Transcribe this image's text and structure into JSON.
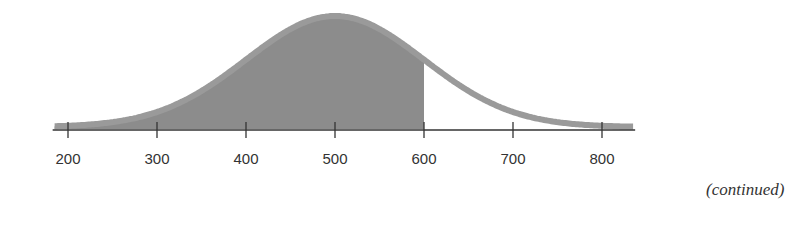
{
  "chart_data": {
    "type": "area",
    "title": "",
    "xlabel": "",
    "ylabel": "",
    "distribution": "normal",
    "mean": 500,
    "std_dev": 100,
    "xlim": [
      160,
      840
    ],
    "shaded_region": {
      "from": 160,
      "to": 600
    },
    "x_ticks": [
      200,
      300,
      400,
      500,
      600,
      700,
      800
    ],
    "x_tick_labels": [
      "200",
      "300",
      "400",
      "500",
      "600",
      "700",
      "800"
    ],
    "grid": false,
    "colors": {
      "curve": "#9a9a9a",
      "shade": "#8c8c8c",
      "axis": "#333333"
    }
  },
  "footer": {
    "continued_label": "(continued)"
  }
}
